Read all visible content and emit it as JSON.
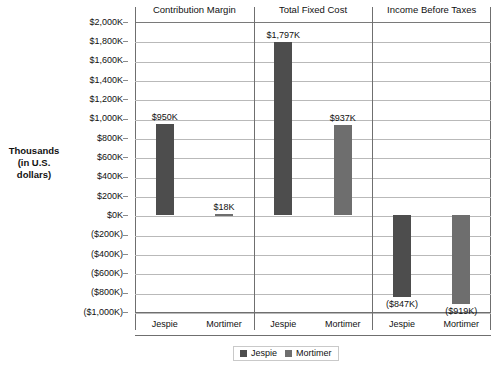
{
  "chart_data": {
    "type": "bar",
    "title": "",
    "subtitle": "",
    "ylabel_line1": "Thousands",
    "ylabel_line2": "(in U.S. dollars)",
    "xlabel": "",
    "grid": true,
    "legend_position": "bottom-center",
    "ylim": [
      -1000,
      2000
    ],
    "ytick_step": 200,
    "ytick_labels": [
      "$2,000K",
      "$1,800K",
      "$1,600K",
      "$1,400K",
      "$1,200K",
      "$1,000K",
      "$800K",
      "$600K",
      "$400K",
      "$200K",
      "$0K",
      "($200K)",
      "($400K)",
      "($600K)",
      "($800K)",
      "($1,000K)"
    ],
    "ytick_values": [
      2000,
      1800,
      1600,
      1400,
      1200,
      1000,
      800,
      600,
      400,
      200,
      0,
      -200,
      -400,
      -600,
      -800,
      -1000
    ],
    "panels": [
      {
        "title": "Contribution Margin",
        "categories": [
          "Jespie",
          "Mortimer"
        ],
        "values": [
          950,
          18
        ],
        "value_labels": [
          "$950K",
          "$18K"
        ]
      },
      {
        "title": "Total Fixed Cost",
        "categories": [
          "Jespie",
          "Mortimer"
        ],
        "values": [
          1797,
          937
        ],
        "value_labels": [
          "$1,797K",
          "$937K"
        ]
      },
      {
        "title": "Income Before Taxes",
        "categories": [
          "Jespie",
          "Mortimer"
        ],
        "values": [
          -847,
          -919
        ],
        "value_labels": [
          "($847K)",
          "($919K)"
        ]
      }
    ],
    "series": [
      {
        "name": "Jespie",
        "color": "#4d4d4d",
        "values": [
          950,
          1797,
          -847
        ]
      },
      {
        "name": "Mortimer",
        "color": "#6e6e6e",
        "values": [
          18,
          937,
          -919
        ]
      }
    ],
    "legend": [
      {
        "label": "Jespie",
        "color": "#4d4d4d"
      },
      {
        "label": "Mortimer",
        "color": "#6e6e6e"
      }
    ]
  }
}
